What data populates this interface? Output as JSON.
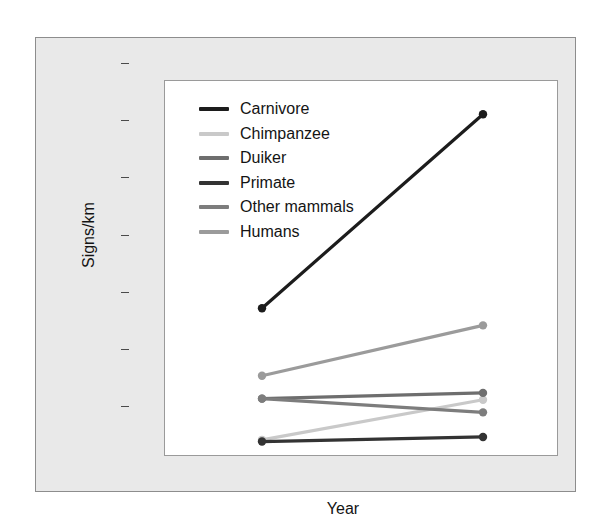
{
  "chart_data": {
    "type": "line",
    "title": "",
    "subtitle": "",
    "xlabel": "Year",
    "ylabel": "Signs/km",
    "categories": [
      "2010/11",
      "2014"
    ],
    "x_tick_labels": [
      "2010/11",
      "2014"
    ],
    "y_tick_labels": [
      "0.00",
      "0.01",
      "0.02",
      "0.03",
      "0.04",
      "0.05",
      "0.06"
    ],
    "y_tick_values": [
      0.0,
      0.01,
      0.02,
      0.03,
      0.04,
      0.05,
      0.06
    ],
    "ylim": [
      -0.0022,
      0.0635
    ],
    "grid": false,
    "legend_position": "upper left (inside panel)",
    "markers": "filled circles at each data point",
    "series": [
      {
        "name": "Carnivore",
        "values": [
          0.0238,
          0.0577
        ],
        "color": "#1c1c1c"
      },
      {
        "name": "Chimpanzee",
        "values": [
          0.0008,
          0.0078
        ],
        "color": "#c9c9c9"
      },
      {
        "name": "Duiker",
        "values": [
          0.008,
          0.009
        ],
        "color": "#6e6e6e"
      },
      {
        "name": "Primate",
        "values": [
          0.0005,
          0.0013
        ],
        "color": "#333333"
      },
      {
        "name": "Other mammals",
        "values": [
          0.008,
          0.0056
        ],
        "color": "#7d7d7d"
      },
      {
        "name": "Humans",
        "values": [
          0.012,
          0.0208
        ],
        "color": "#9b9b9b"
      }
    ]
  },
  "legend": {
    "entries": [
      {
        "label": "Carnivore"
      },
      {
        "label": "Chimpanzee"
      },
      {
        "label": "Duiker"
      },
      {
        "label": "Primate"
      },
      {
        "label": "Other mammals"
      },
      {
        "label": "Humans"
      }
    ]
  },
  "axes": {
    "y_title": "Signs/km",
    "x_title": "Year"
  },
  "colors": {
    "figure_background": "#e9e9e9",
    "panel_background": "#ffffff",
    "panel_border": "#9a9a9a",
    "text": "#141414",
    "axis": "#4a4a4a"
  }
}
